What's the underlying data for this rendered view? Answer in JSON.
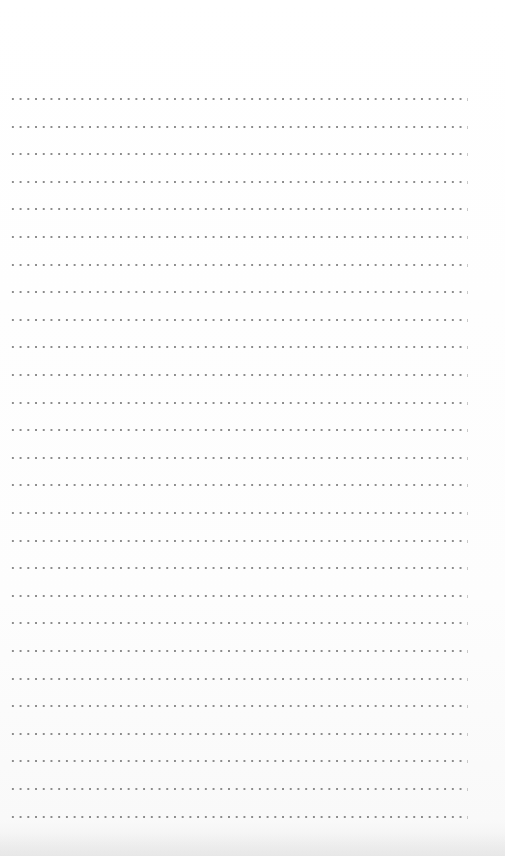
{
  "page": {
    "type": "dotted-ruled-sheet",
    "background_color": "#ffffff",
    "dot_color": "#8c8c8c",
    "tick_color": "#c8c8c8"
  },
  "ruling": {
    "line_count": 27,
    "first_line_y": 99,
    "line_spacing": 27.6,
    "left_x": 9,
    "right_x": 465,
    "dot_spacing": 7.72,
    "dot_size": 2
  },
  "text": []
}
